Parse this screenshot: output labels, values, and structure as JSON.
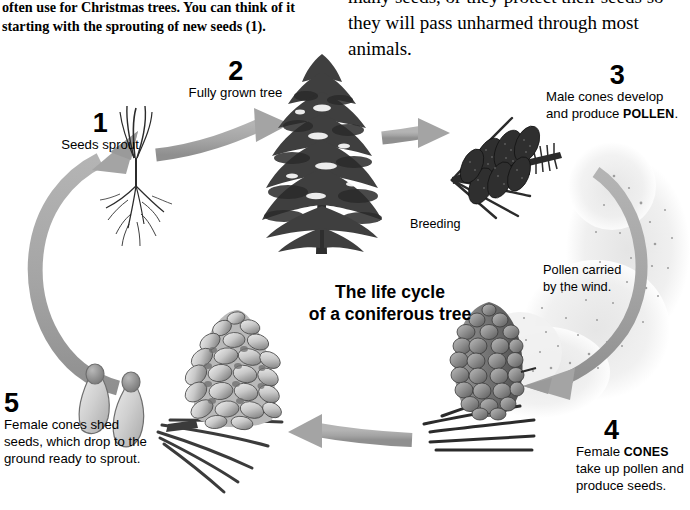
{
  "diagram": {
    "title_line1": "The life cycle",
    "title_line2": "of a coniferous tree",
    "intro_left": "often use for Christmas trees. You can think of it starting with the sprouting of new seeds (1).",
    "intro_right": "many seeds, or they protect their seeds so they will pass unharmed through most animals.",
    "breeding_label": "Breeding",
    "wind_note_line1": "Pollen carried",
    "wind_note_line2": "by the wind."
  },
  "stages": [
    {
      "number": "1",
      "caption": "Seeds sprout",
      "illustration": "seedling-sprout"
    },
    {
      "number": "2",
      "caption": "Fully grown tree",
      "illustration": "conifer-tree"
    },
    {
      "number": "3",
      "caption_prefix": "Male cones develop and produce ",
      "caption_emphasis": "POLLEN",
      "caption_suffix": ".",
      "illustration": "male-cones-branch"
    },
    {
      "number": "4",
      "caption_prefix": "Female ",
      "caption_emphasis": "CONES",
      "caption_suffix": " take up pollen and produce seeds.",
      "illustration": "female-cone-closed"
    },
    {
      "number": "5",
      "caption": "Female cones shed seeds, which drop to the ground ready to sprout.",
      "illustration": "open-pine-cone"
    }
  ],
  "arrows": [
    {
      "name": "arrow-seedling-to-tree",
      "direction": "right"
    },
    {
      "name": "arrow-tree-to-male-cones",
      "direction": "right"
    },
    {
      "name": "arrow-pollen-wind",
      "direction": "down-left-curve"
    },
    {
      "name": "arrow-female-cone-to-open-cone",
      "direction": "left"
    },
    {
      "name": "arrow-seeds-to-seedling",
      "direction": "up-curve"
    }
  ],
  "colors": {
    "arrow_gray": "#a6a6a6",
    "arrow_gray_dark": "#949494",
    "tree_dark": "#3d3d3d",
    "cone_dark": "#2f2f2f",
    "cone_mid": "#757575",
    "seed_light": "#c9c9c9",
    "pollen_haze": "#ebebeb",
    "text_black": "#000000",
    "background": "#ffffff"
  }
}
